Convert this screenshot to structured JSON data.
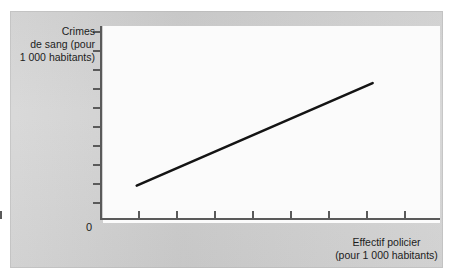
{
  "figure": {
    "background_color": "#ffffff",
    "panel_color": "#d2d2d2",
    "plot_background_color": "#fbfbfb",
    "axis_color": "#5a5a5a",
    "series_color": "#141414",
    "text_color": "#1c1c1c"
  },
  "axis": {
    "origin_label": "0",
    "y_title_lines": [
      "Crimes",
      "de sang (pour",
      "1 000 habitants)"
    ],
    "x_title_lines": [
      "Effectif policier",
      "(pour 1 000 habitants)"
    ],
    "y_tick_count": 10,
    "x_tick_count": 9
  },
  "chart_data": {
    "type": "line",
    "title": "",
    "subtitle": "",
    "xlabel": "Effectif policier (pour 1 000 habitants)",
    "ylabel": "Crimes de sang (pour 1 000 habitants)",
    "x": [
      1,
      8
    ],
    "series": [
      {
        "name": "Relation effectif policier / crimes de sang",
        "values": [
          1.9,
          7.1
        ]
      }
    ],
    "xlim": [
      0,
      10
    ],
    "ylim": [
      0,
      10
    ],
    "grid": false,
    "legend": "none",
    "axis_tick_labels": {
      "x": [
        "",
        "",
        "",
        "",
        "",
        "",
        "",
        "",
        ""
      ],
      "y": [
        "",
        "",
        "",
        "",
        "",
        "",
        "",
        "",
        "",
        ""
      ]
    },
    "annotations": [
      {
        "text": "0",
        "x": 0,
        "y": 0
      }
    ]
  }
}
